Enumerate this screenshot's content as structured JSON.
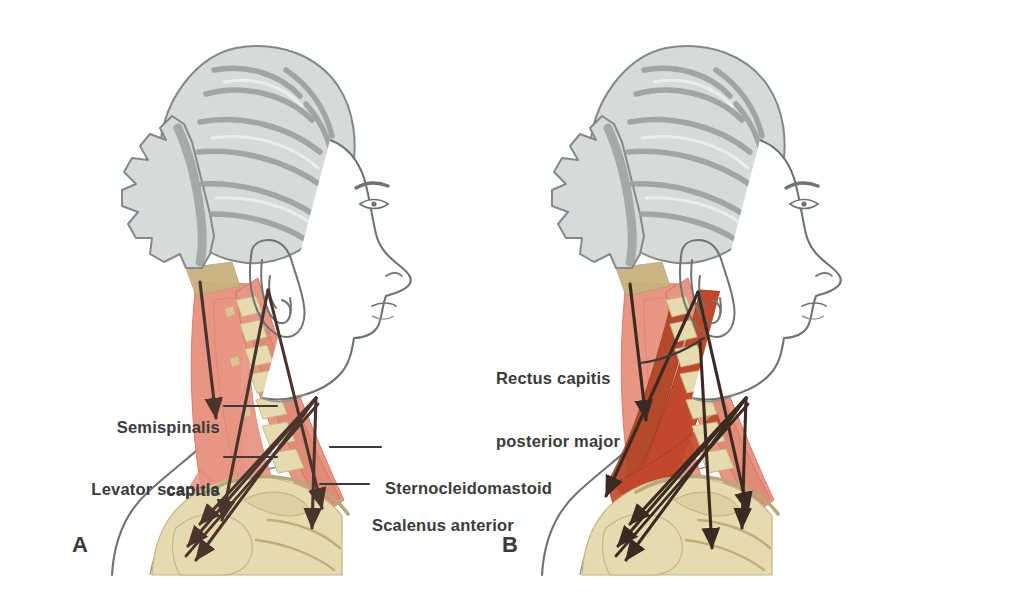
{
  "figure": {
    "background": "#ffffff"
  },
  "palette": {
    "muscle_salmon": "#e99583",
    "muscle_salmon_dark": "#dd7e68",
    "muscle_deep_red": "#c1482a",
    "muscle_deep_red_2": "#b04324",
    "bone_cream": "#e6dbae",
    "bone_cream_dark": "#d8c98f",
    "hair_gray": "#d6dbd8",
    "hair_gray_dark": "#9ba19e",
    "outline_gray": "#6e7471",
    "vector_dark": "#4a342c",
    "label_text": "#3b3b3b",
    "leader_line": "#3b3b3b",
    "skin_white": "#ffffff",
    "tendon_tan": "#c8b37e"
  },
  "panels": [
    {
      "id": "A",
      "letter": "A",
      "letter_pos": {
        "x": 72,
        "y": 532
      },
      "labels": [
        {
          "name": "semispinalis-capitis",
          "lines": [
            "Semispinalis",
            "capitis"
          ],
          "align": "right",
          "x": 68,
          "y": 375,
          "width": 152,
          "leader": {
            "x1": 224,
            "y1": 406,
            "x2": 277,
            "y2": 406
          }
        },
        {
          "name": "levator-scapula",
          "lines": [
            "Levator scapula"
          ],
          "align": "right",
          "x": 50,
          "y": 437,
          "width": 170,
          "leader": {
            "x1": 224,
            "y1": 457,
            "x2": 277,
            "y2": 457
          }
        },
        {
          "name": "sternocleidomastoid",
          "lines": [
            "Sternocleidomastoid"
          ],
          "align": "left",
          "x": 385,
          "y": 428,
          "width": 220,
          "leader": {
            "x1": 330,
            "y1": 447,
            "x2": 381,
            "y2": 447
          }
        },
        {
          "name": "scalenus-anterior",
          "lines": [
            "Scalenus anterior"
          ],
          "align": "left",
          "x": 372,
          "y": 465,
          "width": 200,
          "leader": {
            "x1": 320,
            "y1": 484,
            "x2": 369,
            "y2": 484
          }
        }
      ]
    },
    {
      "id": "B",
      "letter": "B",
      "letter_pos": {
        "x": 502,
        "y": 532
      },
      "labels": [
        {
          "name": "rectus-capitis-posterior-major",
          "lines": [
            "Rectus capitis",
            "posterior major"
          ],
          "align": "left",
          "x": 496,
          "y": 326,
          "width": 180,
          "leader": {
            "x1": 640,
            "y1": 363,
            "x2": 700,
            "y2": 340
          }
        }
      ]
    }
  ],
  "muscle_vectors": {
    "panel_a_count": 7,
    "panel_b_count": 8,
    "description": "Dark force vector arrows overlaid on the cervical musculature"
  }
}
